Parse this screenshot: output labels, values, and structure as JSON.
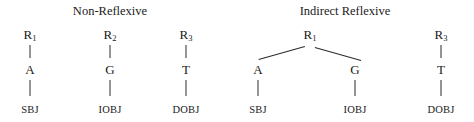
{
  "figure": {
    "type": "syntactic-tree-diagram",
    "background": "#ffffff",
    "ink": "#1a1a1a"
  },
  "panels": [
    {
      "id": "non-reflexive",
      "title": "Non-Reflexive",
      "title_x": 110,
      "title_y": 4,
      "structure": "three separate unary chains",
      "trees": [
        {
          "root": {
            "label": "R",
            "subscript": "1",
            "x": 30,
            "y": 28
          },
          "middle": {
            "label": "A",
            "x": 30,
            "y": 63
          },
          "leaf": {
            "label": "SBJ",
            "x": 30,
            "y": 104
          },
          "edges": [
            {
              "type": "vertical",
              "x": 30,
              "y1": 45,
              "y2": 58
            },
            {
              "type": "vertical",
              "x": 30,
              "y1": 80,
              "y2": 96
            }
          ]
        },
        {
          "root": {
            "label": "R",
            "subscript": "2",
            "x": 110,
            "y": 28
          },
          "middle": {
            "label": "G",
            "x": 110,
            "y": 63
          },
          "leaf": {
            "label": "IOBJ",
            "x": 110,
            "y": 104
          },
          "edges": [
            {
              "type": "vertical",
              "x": 110,
              "y1": 45,
              "y2": 58
            },
            {
              "type": "vertical",
              "x": 110,
              "y1": 80,
              "y2": 96
            }
          ]
        },
        {
          "root": {
            "label": "R",
            "subscript": "3",
            "x": 186,
            "y": 28
          },
          "middle": {
            "label": "T",
            "x": 186,
            "y": 63
          },
          "leaf": {
            "label": "DOBJ",
            "x": 186,
            "y": 104
          },
          "edges": [
            {
              "type": "vertical",
              "x": 186,
              "y1": 45,
              "y2": 58
            },
            {
              "type": "vertical",
              "x": 186,
              "y1": 80,
              "y2": 96
            }
          ]
        }
      ]
    },
    {
      "id": "indirect-reflexive",
      "title": "Indirect Reflexive",
      "title_x": 345,
      "title_y": 4,
      "structure": "one binary branching tree plus one unary chain",
      "trees": [
        {
          "root": {
            "label": "R",
            "subscript": "1",
            "x": 310,
            "y": 28
          },
          "children": [
            {
              "label": "A",
              "x": 258,
              "y": 63
            },
            {
              "label": "G",
              "x": 355,
              "y": 63
            }
          ],
          "leaves": [
            {
              "label": "SBJ",
              "x": 258,
              "y": 104
            },
            {
              "label": "IOBJ",
              "x": 355,
              "y": 104
            }
          ],
          "edges": [
            {
              "type": "diagonal",
              "x1": 305,
              "y1": 47,
              "x2": 259,
              "y2": 60
            },
            {
              "type": "diagonal",
              "x1": 315,
              "y1": 47,
              "x2": 361,
              "y2": 60
            },
            {
              "type": "vertical",
              "x": 258,
              "y1": 80,
              "y2": 96
            },
            {
              "type": "vertical",
              "x": 355,
              "y1": 80,
              "y2": 96
            }
          ]
        },
        {
          "root": {
            "label": "R",
            "subscript": "3",
            "x": 441,
            "y": 28
          },
          "middle": {
            "label": "T",
            "x": 441,
            "y": 63
          },
          "leaf": {
            "label": "DOBJ",
            "x": 441,
            "y": 104
          },
          "edges": [
            {
              "type": "vertical",
              "x": 441,
              "y1": 45,
              "y2": 58
            },
            {
              "type": "vertical",
              "x": 441,
              "y1": 80,
              "y2": 96
            }
          ]
        }
      ]
    }
  ],
  "labels": {
    "title_non_reflexive": "Non-Reflexive",
    "title_indirect_reflexive": "Indirect Reflexive",
    "r1": "R",
    "r2": "R",
    "r3": "R",
    "sub1": "1",
    "sub2": "2",
    "sub3": "3",
    "a": "A",
    "g": "G",
    "t": "T",
    "sbj": "SBJ",
    "iobj": "IOBJ",
    "dobj": "DOBJ"
  }
}
